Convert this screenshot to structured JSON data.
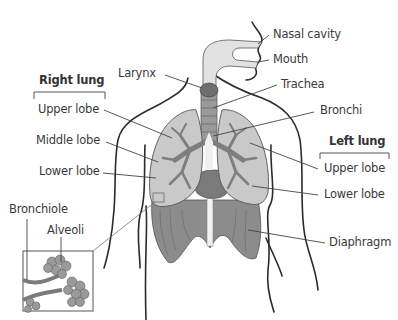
{
  "diagram": {
    "groups": {
      "right_lung": "Right lung",
      "left_lung": "Left lung"
    },
    "labels": {
      "nasal_cavity": "Nasal cavity",
      "mouth": "Mouth",
      "larynx": "Larynx",
      "trachea": "Trachea",
      "bronchi": "Bronchi",
      "right_upper_lobe": "Upper lobe",
      "right_middle_lobe": "Middle lobe",
      "right_lower_lobe": "Lower lobe",
      "left_upper_lobe": "Upper lobe",
      "left_lower_lobe": "Lower lobe",
      "diaphragm": "Diaphragm",
      "bronchiole": "Bronchiole",
      "alveoli": "Alveoli"
    },
    "colors": {
      "outline": "#2b2b2b",
      "lung_fill": "#c9c9c9",
      "airway_fill": "#8a8a8a",
      "larynx_fill": "#6e6e6e",
      "diaphragm_fill": "#8c8c8c",
      "nasal_fill": "#e2e2e2",
      "leader_line": "#444444"
    }
  }
}
